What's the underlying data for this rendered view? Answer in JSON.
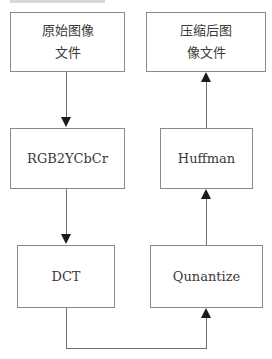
{
  "diagram": {
    "type": "flowchart",
    "title_fragment": "",
    "nodes": [
      {
        "id": "src",
        "lines": [
          "原始图像",
          "文件"
        ]
      },
      {
        "id": "rgb",
        "lines": [
          "RGB2YCbCr"
        ]
      },
      {
        "id": "dct",
        "lines": [
          "DCT"
        ]
      },
      {
        "id": "quant",
        "lines": [
          "Qunantize"
        ]
      },
      {
        "id": "huff",
        "lines": [
          "Huffman"
        ]
      },
      {
        "id": "out",
        "lines": [
          "压缩后图",
          "像文件"
        ]
      }
    ],
    "edges": [
      {
        "from": "src",
        "to": "rgb"
      },
      {
        "from": "rgb",
        "to": "dct"
      },
      {
        "from": "dct",
        "to": "quant"
      },
      {
        "from": "quant",
        "to": "huff"
      },
      {
        "from": "huff",
        "to": "out"
      }
    ]
  }
}
